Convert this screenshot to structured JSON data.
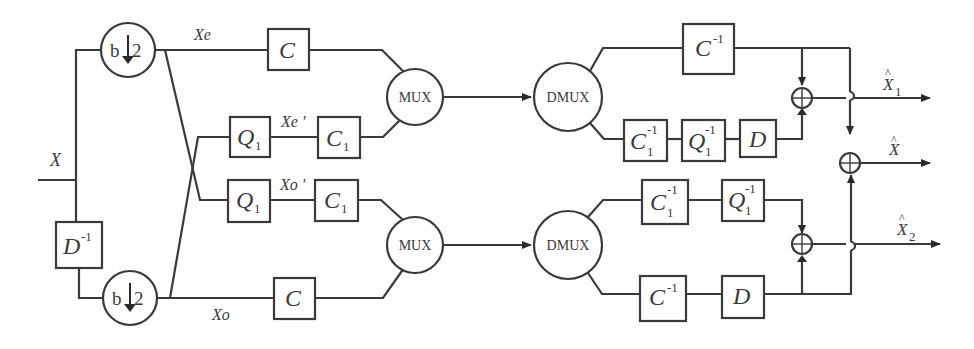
{
  "diagram": {
    "type": "block-diagram",
    "input_label": "X",
    "delay_block": {
      "base": "D",
      "sup": "-1"
    },
    "downsamplers": [
      {
        "id": "ds-top",
        "label": "b",
        "arrow": "↓",
        "factor": "2"
      },
      {
        "id": "ds-bottom",
        "label": "b",
        "arrow": "↓",
        "factor": "2"
      }
    ],
    "signal_labels": {
      "xe": "Xe",
      "xe_prime": "Xe '",
      "xo_prime": "Xo '",
      "xo": "Xo"
    },
    "encoder_blocks": {
      "c_top": {
        "base": "C"
      },
      "q1_upper": {
        "base": "Q",
        "sub": "1"
      },
      "c1_upper": {
        "base": "C",
        "sub": "1"
      },
      "q1_lower": {
        "base": "Q",
        "sub": "1"
      },
      "c1_lower": {
        "base": "C",
        "sub": "1"
      },
      "c_bottom": {
        "base": "C"
      }
    },
    "mux_label": "MUX",
    "dmux_label": "DMUX",
    "decoder_blocks": {
      "cinv_top": {
        "base": "C",
        "sup": "-1"
      },
      "c1inv_upper": {
        "base": "C",
        "sub": "1",
        "sup": "-1"
      },
      "q1inv_upper": {
        "base": "Q",
        "sub": "1",
        "sup": "-1"
      },
      "d_upper": {
        "base": "D"
      },
      "c1inv_lower": {
        "base": "C",
        "sub": "1",
        "sup": "-1"
      },
      "q1inv_lower": {
        "base": "Q",
        "sub": "1",
        "sup": "-1"
      },
      "cinv_bottom": {
        "base": "C",
        "sup": "-1"
      },
      "d_lower": {
        "base": "D"
      }
    },
    "adder_symbol": "⊕",
    "outputs": [
      {
        "id": "x1-hat",
        "base": "X",
        "hat": "^",
        "sub": "1"
      },
      {
        "id": "x-hat",
        "base": "X",
        "hat": "^"
      },
      {
        "id": "x2-hat",
        "base": "X",
        "hat": "^",
        "sub": "2"
      }
    ],
    "colors": {
      "line": "#3a3a3a",
      "background": "#ffffff"
    }
  }
}
